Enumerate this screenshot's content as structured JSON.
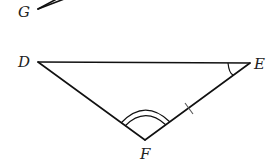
{
  "figure": {
    "type": "triangle-diagram",
    "labels": {
      "G": "G",
      "D": "D",
      "E": "E",
      "F": "F"
    },
    "vertices": {
      "G": {
        "x": 38,
        "y": 9
      },
      "D": {
        "x": 38,
        "y": 62
      },
      "E": {
        "x": 250,
        "y": 63
      },
      "F": {
        "x": 145,
        "y": 140
      }
    },
    "markings": {
      "angle_E": "single arc",
      "angle_F": "double arc",
      "side_EF": "single tick mark"
    },
    "colors": {
      "line": "#111111",
      "label": "#222222",
      "background": "#ffffff"
    }
  }
}
